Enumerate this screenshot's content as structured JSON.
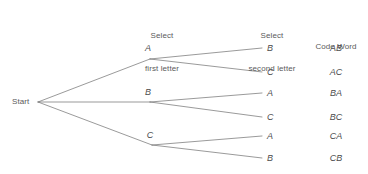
{
  "figure": {
    "type": "tree-diagram",
    "headers": {
      "first_stage": {
        "line1": "Select",
        "line2": "first letter"
      },
      "second_stage": {
        "line1": "Select",
        "line2": "second letter"
      },
      "outcome": {
        "line1": "",
        "line2": "Code Word"
      }
    },
    "root": {
      "label": "Start"
    },
    "stage1_nodes": [
      {
        "label": "A"
      },
      {
        "label": "B"
      },
      {
        "label": "C"
      }
    ],
    "stage2_nodes": [
      {
        "label": "B"
      },
      {
        "label": "C"
      },
      {
        "label": "A"
      },
      {
        "label": "C"
      },
      {
        "label": "A"
      },
      {
        "label": "B"
      }
    ],
    "code_words": [
      {
        "label": "AB"
      },
      {
        "label": "AC"
      },
      {
        "label": "BA"
      },
      {
        "label": "BC"
      },
      {
        "label": "CA"
      },
      {
        "label": "CB"
      }
    ],
    "colors": {
      "line": "#6e6e6e",
      "text": "#5a5a5a",
      "background": "#ffffff"
    }
  }
}
